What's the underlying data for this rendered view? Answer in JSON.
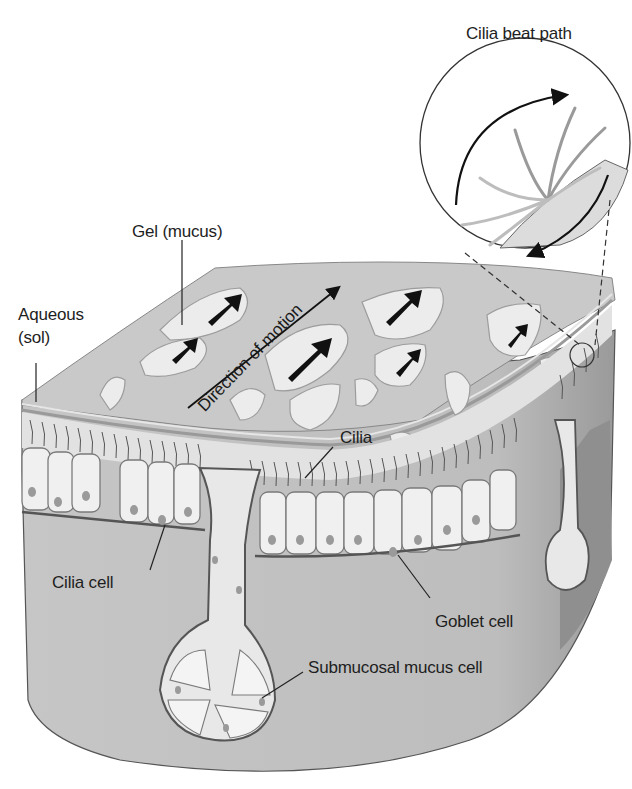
{
  "diagram": {
    "labels": {
      "cilia_beat_path": "Cilia beat path",
      "gel": "Gel (mucus)",
      "aqueous_line1": "Aqueous",
      "aqueous_line2": "(sol)",
      "direction": "Direction of motion",
      "cilia": "Cilia",
      "cilia_cell": "Cilia cell",
      "goblet_cell": "Goblet cell",
      "submucosal": "Submucosal mucus cell"
    },
    "colors": {
      "background": "#ffffff",
      "gel_surface": "#c9c9c9",
      "gel_blob": "#ececec",
      "tissue": "#c2c2c2",
      "tissue_dark": "#a9a9a9",
      "cell_fill": "#f0f0f0",
      "cell_outline": "#7a7a7a",
      "nucleus": "#9a9a9a",
      "arrow": "#111111",
      "text": "#1e1e1e"
    }
  }
}
